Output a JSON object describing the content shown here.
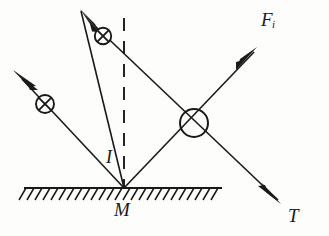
{
  "figure": {
    "type": "physics-ray-diagram",
    "background_color": "#fdfdfb",
    "stroke_color": "#1a1a1a",
    "labels": {
      "force_up_right": "F",
      "force_up_right_subscript": "i",
      "ray_down_right": "T",
      "surface_point": "M",
      "normal_line": "I"
    },
    "icons": {
      "polarization_marker": "circle-x-icon",
      "arrowhead": "arrowhead-icon",
      "ground_hatching": "hatched-surface-icon",
      "normal": "dashed-normal-line-icon"
    },
    "geometry": {
      "surface_line": {
        "x1": 24,
        "y1": 188,
        "x2": 222,
        "y2": 188
      },
      "normal_dashed": {
        "x1": 124,
        "y1": 18,
        "x2": 124,
        "y2": 188
      },
      "incident_ray_upper": {
        "x1": 80,
        "y1": 10,
        "x2": 278,
        "y2": 203
      },
      "incident_ray_lower": {
        "x1": 14,
        "y1": 72,
        "x2": 255,
        "y2": 48
      },
      "vertex": {
        "x": 124,
        "y": 188
      },
      "crossing_point": {
        "x": 194,
        "y": 124
      }
    },
    "markers": [
      {
        "name": "polarization-marker-upper",
        "cx": 103,
        "cy": 36,
        "r": 8
      },
      {
        "name": "polarization-marker-lower",
        "cx": 46,
        "cy": 104,
        "r": 9
      },
      {
        "name": "polarization-marker-crossing",
        "cx": 194,
        "cy": 124,
        "r": 14
      }
    ]
  }
}
